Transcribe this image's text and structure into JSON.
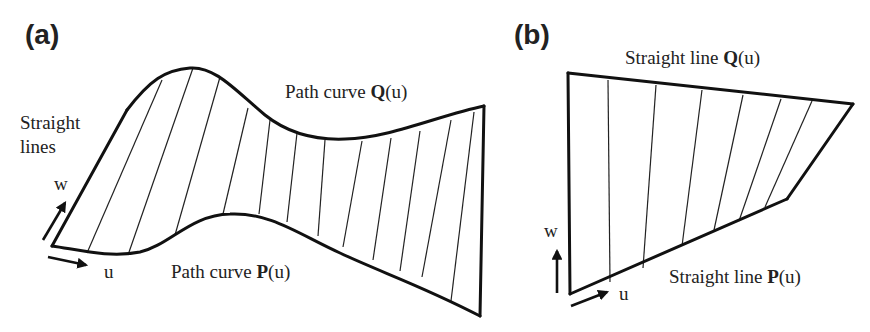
{
  "figure": {
    "panels": [
      {
        "id": "a",
        "label": "(a)",
        "top_curve_label": {
          "prefix": "Path curve ",
          "symbol": "Q",
          "suffix": "(u)"
        },
        "bottom_curve_label": {
          "prefix": "Path curve ",
          "symbol": "P",
          "suffix": "(u)"
        },
        "side_label_line1": "Straight",
        "side_label_line2": "lines",
        "w_axis_label": "w",
        "u_axis_label": "u"
      },
      {
        "id": "b",
        "label": "(b)",
        "top_curve_label": {
          "prefix": "Straight line ",
          "symbol": "Q",
          "suffix": "(u)"
        },
        "bottom_curve_label": {
          "prefix": "Straight line ",
          "symbol": "P",
          "suffix": "(u)"
        },
        "w_axis_label": "w",
        "u_axis_label": "u"
      }
    ],
    "colors": {
      "stroke": "#111111",
      "background": "#ffffff",
      "text": "#222222"
    }
  }
}
